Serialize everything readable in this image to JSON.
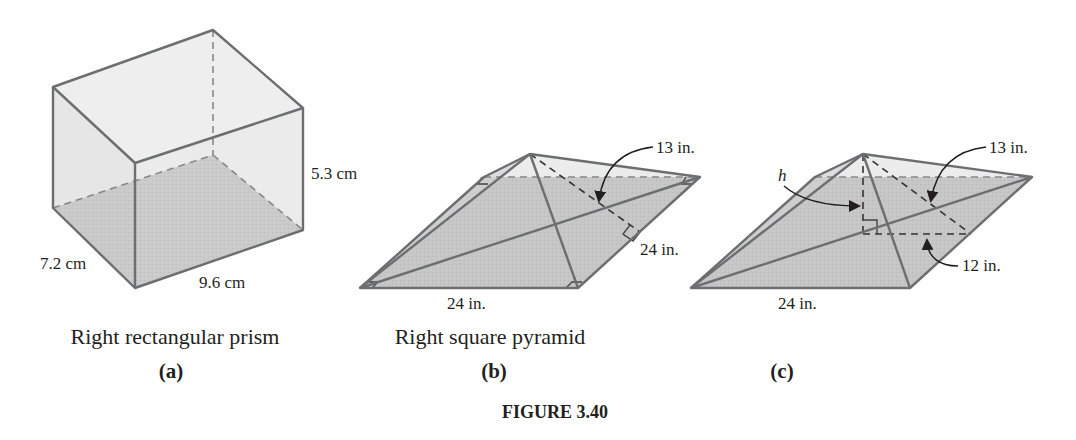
{
  "figure": {
    "title": "FIGURE 3.40",
    "panels": [
      {
        "id": "a",
        "sublabel": "(a)",
        "caption": "Right rectangular prism",
        "dimensions": {
          "depth": "7.2 cm",
          "width": "9.6 cm",
          "height": "5.3 cm"
        }
      },
      {
        "id": "b",
        "sublabel": "(b)",
        "caption": "Right square pyramid",
        "dimensions": {
          "slant_height": "13 in.",
          "base_side_right": "24 in.",
          "base_side_front": "24 in."
        }
      },
      {
        "id": "c",
        "sublabel": "(c)",
        "caption": "",
        "dimensions": {
          "height_symbol": "h",
          "slant_height": "13 in.",
          "half_base": "12 in.",
          "base_side_front": "24 in."
        }
      }
    ]
  },
  "colors": {
    "edge": "#6d6e71",
    "base_fill": "#c9c9c9",
    "face_fill": "#ececec",
    "text": "#231f20"
  }
}
